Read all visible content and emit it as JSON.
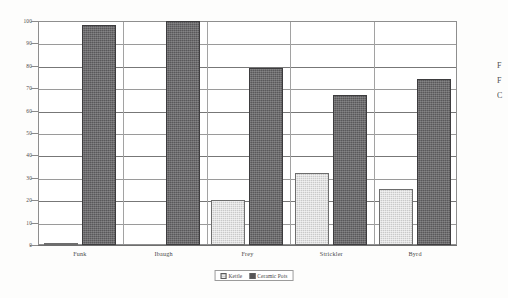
{
  "chart_data": {
    "type": "bar",
    "title": "",
    "subtitle": "",
    "xlabel": "",
    "ylabel": "",
    "ylim": [
      0,
      100
    ],
    "ytick_step": 10,
    "yticks": [
      0,
      10,
      20,
      30,
      40,
      50,
      60,
      70,
      80,
      90,
      100
    ],
    "ytick_labels": [
      "0",
      "10",
      "20",
      "30",
      "40",
      "50",
      "60",
      "70",
      "80",
      "90",
      "100"
    ],
    "categories": [
      "Funk",
      "Ibaugh",
      "Frey",
      "Strickler",
      "Byrd"
    ],
    "series": [
      {
        "name": "Kettle",
        "color": "#c9c9c9",
        "values": [
          1,
          0,
          20,
          32,
          25
        ]
      },
      {
        "name": "Ceramic Pots",
        "color": "#59585a",
        "values": [
          98,
          100,
          79,
          67,
          74
        ]
      }
    ],
    "legend": {
      "position": "bottom-center",
      "entries": [
        "Kettle",
        "Ceramic Pots"
      ]
    },
    "grid": {
      "horizontal": true,
      "vertical_category_separators": true
    },
    "annotations": []
  },
  "margin_text": {
    "lines": [
      "F",
      "F",
      "C"
    ]
  }
}
